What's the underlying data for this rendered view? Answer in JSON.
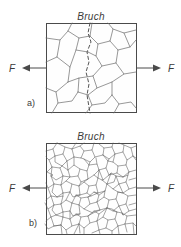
{
  "figure": {
    "title_a": "Bruch",
    "title_b": "Bruch",
    "label_a": "a)",
    "label_b": "b)",
    "force_left_a": "F",
    "force_right_a": "F",
    "force_left_b": "F",
    "force_right_b": "F",
    "colors": {
      "background": "#ffffff",
      "box_stroke": "#4a4a4a",
      "grain_stroke": "#6b6b6b",
      "crack_stroke": "#555555",
      "text": "#3a3a3a"
    },
    "panels": [
      {
        "id": "a",
        "description": "coarse-grained-microstructure",
        "box": {
          "x": 46,
          "y": 23,
          "w": 91,
          "h": 90
        },
        "crack_path": "M 90 23 L 88 33 L 91 42 L 87 52 L 89 62 L 86 72 L 89 84 L 87 95 L 90 113"
      },
      {
        "id": "b",
        "description": "fine-grained-microstructure",
        "box": {
          "x": 46,
          "y": 143,
          "w": 91,
          "h": 92
        }
      }
    ],
    "arrows": [
      {
        "name": "force-arrow-left-a",
        "dir": "left",
        "y": 68,
        "from_x": 46,
        "to_x": 22
      },
      {
        "name": "force-arrow-right-a",
        "dir": "right",
        "y": 68,
        "from_x": 137,
        "to_x": 161
      },
      {
        "name": "force-arrow-left-b",
        "dir": "left",
        "y": 188,
        "from_x": 46,
        "to_x": 22
      },
      {
        "name": "force-arrow-right-b",
        "dir": "right",
        "y": 188,
        "from_x": 137,
        "to_x": 161
      }
    ]
  }
}
